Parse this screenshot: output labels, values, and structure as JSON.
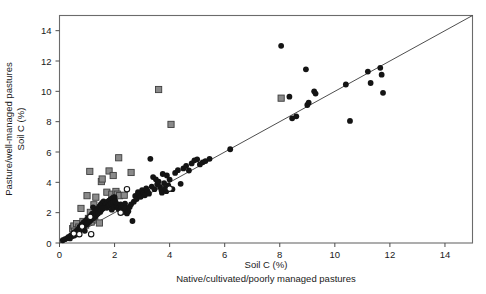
{
  "figure": {
    "width": 486,
    "height": 294,
    "background": "#ffffff"
  },
  "chart_data": {
    "type": "scatter",
    "title": "",
    "xlabel_line1": "Soil C (%)",
    "xlabel_line2": "Native/cultivated/poorly managed pastures",
    "ylabel_line1": "Soil C (%)",
    "ylabel_line2": "Pasture/well-managed pastures",
    "xlim": [
      0,
      15
    ],
    "ylim": [
      0,
      15
    ],
    "xticks": [
      0,
      2,
      4,
      6,
      8,
      10,
      12,
      14
    ],
    "yticks": [
      0,
      2,
      4,
      6,
      8,
      10,
      12,
      14
    ],
    "xticklabels": [
      "0",
      "2",
      "4",
      "6",
      "8",
      "10",
      "12",
      "14"
    ],
    "yticklabels": [
      "0",
      "2",
      "4",
      "6",
      "8",
      "10",
      "12",
      "14"
    ],
    "grid": false,
    "legend": "none",
    "reference_line": {
      "name": "1:1 line",
      "from": [
        0,
        0
      ],
      "to": [
        15,
        15
      ],
      "color": "#3a3a3a"
    },
    "colors": {
      "filled_circle": "#141414",
      "open_circle": "#ffffff",
      "gray_square": "#8a8a8a",
      "frame": "#6b6b6b"
    },
    "series": [
      {
        "name": "filled-circles",
        "marker": "filled-circle",
        "color": "#141414",
        "points": [
          [
            0.12,
            0.18
          ],
          [
            0.2,
            0.25
          ],
          [
            0.28,
            0.32
          ],
          [
            0.33,
            0.4
          ],
          [
            0.38,
            0.3
          ],
          [
            0.42,
            0.52
          ],
          [
            0.45,
            0.45
          ],
          [
            0.5,
            0.6
          ],
          [
            0.52,
            0.48
          ],
          [
            0.55,
            0.72
          ],
          [
            0.58,
            0.55
          ],
          [
            0.62,
            0.8
          ],
          [
            0.65,
            0.66
          ],
          [
            0.68,
            0.9
          ],
          [
            0.7,
            0.72
          ],
          [
            0.72,
            1.05
          ],
          [
            0.75,
            0.85
          ],
          [
            0.78,
            1.15
          ],
          [
            0.8,
            0.95
          ],
          [
            0.82,
            1.25
          ],
          [
            0.85,
            1.05
          ],
          [
            0.88,
            1.38
          ],
          [
            0.9,
            1.12
          ],
          [
            0.92,
            0.8
          ],
          [
            0.95,
            1.45
          ],
          [
            0.98,
            1.22
          ],
          [
            1.0,
            1.55
          ],
          [
            1.02,
            1.3
          ],
          [
            1.05,
            1.65
          ],
          [
            1.08,
            1.4
          ],
          [
            1.1,
            1.72
          ],
          [
            1.12,
            1.48
          ],
          [
            1.15,
            1.85
          ],
          [
            1.18,
            1.58
          ],
          [
            1.2,
            1.95
          ],
          [
            1.22,
            2.35
          ],
          [
            1.25,
            1.65
          ],
          [
            1.28,
            2.05
          ],
          [
            1.3,
            1.75
          ],
          [
            1.32,
            2.15
          ],
          [
            1.35,
            1.88
          ],
          [
            1.38,
            2.25
          ],
          [
            1.4,
            1.95
          ],
          [
            1.45,
            2.42
          ],
          [
            1.48,
            2.05
          ],
          [
            1.5,
            2.55
          ],
          [
            1.52,
            2.18
          ],
          [
            1.55,
            2.65
          ],
          [
            1.58,
            2.28
          ],
          [
            1.6,
            2.75
          ],
          [
            1.62,
            2.35
          ],
          [
            1.65,
            2.45
          ],
          [
            1.68,
            2.55
          ],
          [
            1.7,
            2.62
          ],
          [
            1.72,
            2.32
          ],
          [
            1.75,
            2.72
          ],
          [
            1.78,
            2.45
          ],
          [
            1.8,
            2.8
          ],
          [
            1.82,
            2.52
          ],
          [
            1.85,
            2.88
          ],
          [
            1.88,
            2.6
          ],
          [
            1.9,
            2.2
          ],
          [
            1.92,
            2.95
          ],
          [
            1.95,
            2.68
          ],
          [
            1.98,
            2.35
          ],
          [
            2.0,
            3.02
          ],
          [
            2.02,
            2.75
          ],
          [
            2.05,
            2.48
          ],
          [
            2.08,
            2.58
          ],
          [
            2.1,
            2.42
          ],
          [
            2.12,
            2.3
          ],
          [
            2.15,
            2.25
          ],
          [
            2.18,
            2.38
          ],
          [
            2.2,
            2.2
          ],
          [
            2.22,
            2.55
          ],
          [
            2.25,
            2.3
          ],
          [
            2.28,
            2.18
          ],
          [
            2.3,
            2.12
          ],
          [
            2.32,
            2.45
          ],
          [
            2.35,
            2.05
          ],
          [
            2.38,
            2.6
          ],
          [
            2.4,
            2.28
          ],
          [
            2.45,
            1.95
          ],
          [
            2.5,
            2.1
          ],
          [
            2.55,
            2.38
          ],
          [
            2.6,
            2.55
          ],
          [
            2.65,
            1.45
          ],
          [
            2.7,
            2.72
          ],
          [
            2.75,
            3.1
          ],
          [
            2.8,
            2.9
          ],
          [
            2.85,
            3.35
          ],
          [
            2.9,
            3.2
          ],
          [
            2.95,
            3.05
          ],
          [
            3.0,
            3.48
          ],
          [
            3.05,
            3.3
          ],
          [
            3.1,
            3.15
          ],
          [
            3.15,
            3.6
          ],
          [
            3.2,
            3.42
          ],
          [
            3.25,
            3.25
          ],
          [
            3.3,
            5.55
          ],
          [
            3.35,
            3.72
          ],
          [
            3.4,
            4.35
          ],
          [
            3.45,
            3.55
          ],
          [
            3.5,
            4.2
          ],
          [
            3.55,
            3.88
          ],
          [
            3.6,
            4.05
          ],
          [
            3.65,
            3.7
          ],
          [
            3.7,
            3.5
          ],
          [
            3.72,
            3.32
          ],
          [
            3.75,
            4.55
          ],
          [
            3.8,
            3.95
          ],
          [
            3.85,
            3.62
          ],
          [
            3.88,
            3.42
          ],
          [
            3.9,
            4.45
          ],
          [
            3.95,
            3.8
          ],
          [
            4.0,
            4.18
          ],
          [
            4.1,
            3.55
          ],
          [
            4.2,
            4.62
          ],
          [
            4.3,
            4.8
          ],
          [
            4.4,
            3.9
          ],
          [
            4.5,
            4.92
          ],
          [
            4.6,
            5.08
          ],
          [
            4.7,
            4.78
          ],
          [
            4.8,
            5.25
          ],
          [
            4.9,
            5.45
          ],
          [
            5.0,
            5.52
          ],
          [
            5.1,
            5.18
          ],
          [
            5.2,
            5.32
          ],
          [
            5.3,
            5.4
          ],
          [
            5.45,
            5.55
          ],
          [
            6.2,
            6.18
          ],
          [
            8.05,
            13.0
          ],
          [
            8.35,
            9.65
          ],
          [
            8.45,
            8.22
          ],
          [
            8.6,
            8.35
          ],
          [
            8.95,
            11.45
          ],
          [
            9.0,
            9.1
          ],
          [
            9.05,
            9.25
          ],
          [
            9.25,
            10.0
          ],
          [
            9.3,
            9.85
          ],
          [
            10.4,
            10.45
          ],
          [
            10.55,
            8.05
          ],
          [
            11.2,
            11.3
          ],
          [
            11.3,
            10.55
          ],
          [
            11.65,
            11.55
          ],
          [
            11.7,
            11.1
          ],
          [
            11.75,
            9.9
          ]
        ]
      },
      {
        "name": "gray-squares",
        "marker": "gray-square",
        "color": "#8a8a8a",
        "points": [
          [
            0.48,
            0.95
          ],
          [
            0.52,
            1.12
          ],
          [
            0.55,
            0.78
          ],
          [
            0.62,
            1.28
          ],
          [
            0.7,
            1.05
          ],
          [
            0.78,
            2.28
          ],
          [
            0.85,
            1.42
          ],
          [
            0.95,
            1.18
          ],
          [
            1.0,
            3.12
          ],
          [
            1.05,
            1.62
          ],
          [
            1.1,
            4.72
          ],
          [
            1.12,
            2.02
          ],
          [
            1.15,
            1.38
          ],
          [
            1.25,
            2.52
          ],
          [
            1.28,
            1.58
          ],
          [
            1.32,
            3.02
          ],
          [
            1.4,
            2.18
          ],
          [
            1.45,
            1.32
          ],
          [
            1.52,
            4.05
          ],
          [
            1.55,
            4.22
          ],
          [
            1.62,
            2.45
          ],
          [
            1.72,
            3.35
          ],
          [
            1.8,
            4.75
          ],
          [
            1.9,
            3.22
          ],
          [
            1.95,
            4.45
          ],
          [
            2.0,
            2.95
          ],
          [
            2.05,
            3.4
          ],
          [
            2.1,
            3.22
          ],
          [
            2.15,
            5.62
          ],
          [
            2.18,
            3.12
          ],
          [
            2.35,
            3.15
          ],
          [
            2.6,
            4.65
          ],
          [
            3.6,
            10.12
          ],
          [
            4.05,
            7.82
          ],
          [
            8.05,
            9.55
          ]
        ]
      },
      {
        "name": "open-circles",
        "marker": "open-circle",
        "color": "#ffffff",
        "points": [
          [
            0.52,
            0.62
          ],
          [
            0.72,
            0.58
          ],
          [
            0.82,
            1.08
          ],
          [
            1.12,
            1.72
          ],
          [
            1.15,
            0.58
          ],
          [
            2.22,
            2.0
          ],
          [
            2.45,
            3.55
          ],
          [
            4.0,
            3.58
          ]
        ]
      }
    ]
  }
}
